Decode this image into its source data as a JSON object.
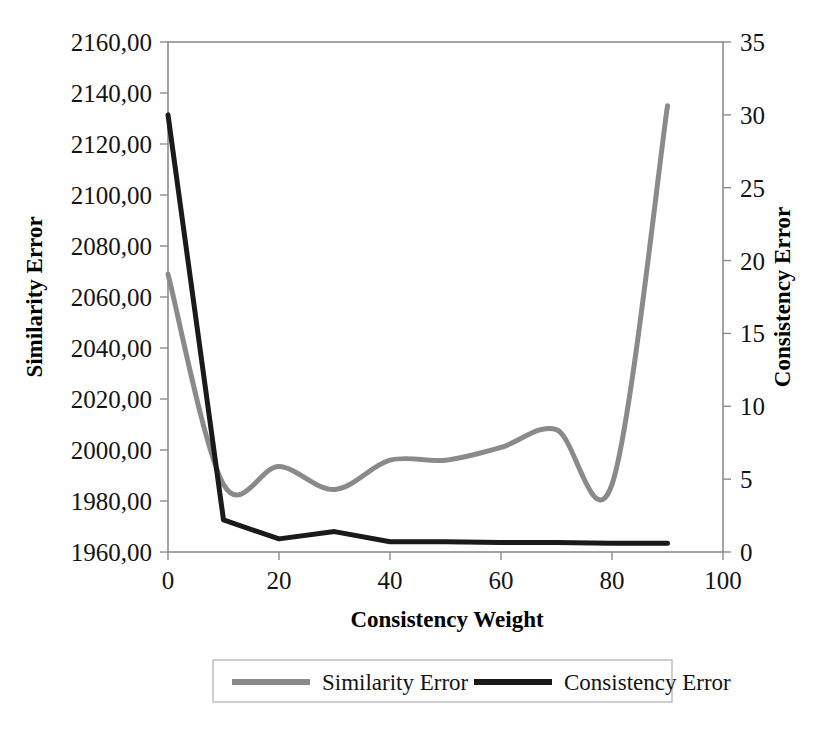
{
  "chart_data": {
    "type": "line",
    "title": "",
    "xlabel": "Consistency Weight",
    "ylabel": "Similarity Error",
    "y2label": "Consistency Error",
    "x": [
      0,
      10,
      20,
      30,
      40,
      50,
      60,
      70,
      80,
      90
    ],
    "xlim": [
      0,
      100
    ],
    "ylim": [
      1960,
      2160
    ],
    "y2lim": [
      0,
      35
    ],
    "grid": false,
    "smooth": true,
    "legend_position": "bottom",
    "xticks": [
      "0",
      "20",
      "40",
      "60",
      "80",
      "100"
    ],
    "xtick_values": [
      0,
      20,
      40,
      60,
      80,
      100
    ],
    "yticks": [
      "1960,00",
      "1980,00",
      "2000,00",
      "2020,00",
      "2040,00",
      "2060,00",
      "2080,00",
      "2100,00",
      "2120,00",
      "2140,00",
      "2160,00"
    ],
    "ytick_values": [
      1960,
      1980,
      2000,
      2020,
      2040,
      2060,
      2080,
      2100,
      2120,
      2140,
      2160
    ],
    "y2ticks": [
      "0",
      "5",
      "10",
      "15",
      "20",
      "25",
      "30",
      "35"
    ],
    "y2tick_values": [
      0,
      5,
      10,
      15,
      20,
      25,
      30,
      35
    ],
    "series": [
      {
        "name": "Similarity Error",
        "axis": "left",
        "color": "#8a8a8a",
        "width": 5,
        "values": [
          2069,
          1986.5,
          1993.5,
          1984.5,
          1996,
          1996,
          2001,
          2008,
          1986.5,
          2135
        ]
      },
      {
        "name": "Consistency Error",
        "axis": "right",
        "color": "#1a1a1a",
        "width": 5,
        "values": [
          30.0,
          2.2,
          0.9,
          1.4,
          0.7,
          0.7,
          0.65,
          0.65,
          0.6,
          0.6
        ]
      }
    ]
  },
  "legend": {
    "items": [
      {
        "label": "Similarity Error",
        "color": "#8a8a8a"
      },
      {
        "label": "Consistency Error",
        "color": "#1a1a1a"
      }
    ]
  }
}
